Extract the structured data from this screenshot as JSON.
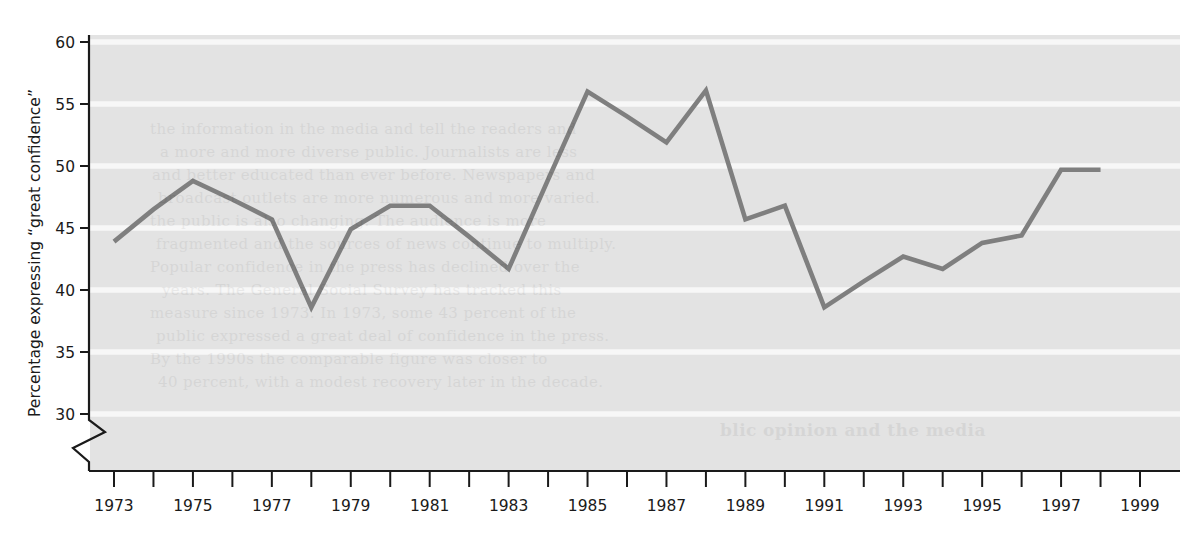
{
  "chart_data": {
    "type": "line",
    "title": "",
    "xlabel": "",
    "ylabel": "Percentage expressing “great confidence”",
    "xlim": [
      1972.5,
      1999.5
    ],
    "ylim": [
      28.4,
      60
    ],
    "yticks": [
      30,
      35,
      40,
      45,
      50,
      55,
      60
    ],
    "ytick_labels": [
      "30",
      "35",
      "40",
      "45",
      "50",
      "55",
      "60"
    ],
    "xticks": [
      1973,
      1974,
      1975,
      1976,
      1977,
      1978,
      1979,
      1980,
      1981,
      1982,
      1983,
      1984,
      1985,
      1986,
      1987,
      1988,
      1989,
      1990,
      1991,
      1992,
      1993,
      1994,
      1995,
      1996,
      1997,
      1998,
      1999
    ],
    "xtick_labels_shown": [
      "1973",
      "1975",
      "1977",
      "1979",
      "1981",
      "1983",
      "1985",
      "1987",
      "1989",
      "1991",
      "1993",
      "1995",
      "1997",
      "1999"
    ],
    "axis_break": true,
    "axis_break_note": "zigzag break on y-axis below 30",
    "grid": "horizontal white gridlines on gray plot background",
    "legend": null,
    "x": [
      1973,
      1974,
      1975,
      1976,
      1977,
      1978,
      1979,
      1980,
      1981,
      1982,
      1983,
      1984,
      1985,
      1986,
      1987,
      1988,
      1989,
      1990,
      1991,
      1992,
      1993,
      1994,
      1995,
      1996,
      1997,
      1998
    ],
    "values": [
      43.9,
      46.5,
      48.8,
      47.3,
      45.7,
      38.6,
      44.9,
      46.8,
      46.8,
      44.3,
      41.7,
      48.9,
      56.0,
      54.0,
      51.9,
      56.1,
      45.7,
      46.8,
      38.6,
      40.7,
      42.7,
      41.7,
      43.8,
      44.4,
      49.7,
      49.7
    ],
    "series": [
      {
        "name": "Percentage expressing “great confidence”",
        "color": "#7f7f7f",
        "values": [
          43.9,
          46.5,
          48.8,
          47.3,
          45.7,
          38.6,
          44.9,
          46.8,
          46.8,
          44.3,
          41.7,
          48.9,
          56.0,
          54.0,
          51.9,
          56.1,
          45.7,
          46.8,
          38.6,
          40.7,
          42.7,
          41.7,
          43.8,
          44.4,
          49.7,
          49.7
        ]
      }
    ]
  },
  "style": {
    "plot_background": "#e3e3e3",
    "gridline_color": "#f7f7f7",
    "line_color": "#808080",
    "axis_color": "#1a1a1a",
    "page_background": "#ffffff"
  },
  "ghost_text": {
    "lines": [
      "the information in the media and tell the readers and",
      "a more and more diverse public. Journalists are less",
      "and better educated than ever before. Newspapers and",
      "broadcast outlets are more numerous and more varied.",
      "the public is also changing. The audience is more",
      "fragmented and the sources of news continue to multiply.",
      "Popular confidence in the press has declined over the",
      "years. The General Social Survey has tracked this",
      "measure since 1973. In 1973, some 43 percent of the",
      "public expressed a great deal of confidence in the press.",
      "By the 1990s the comparable figure was closer to",
      "40 percent, with a modest recovery later in the decade."
    ],
    "heading": "blic opinion and the media"
  }
}
